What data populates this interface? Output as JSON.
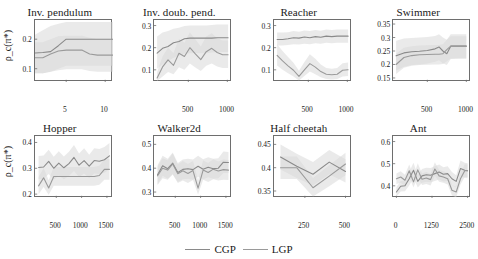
{
  "figure": {
    "ylabel": "ρ_c(π*)",
    "legend": [
      {
        "name": "CGP",
        "color": "#8a8a8a"
      },
      {
        "name": "LGP",
        "color": "#9a9a9a"
      }
    ]
  },
  "chart_data": [
    {
      "type": "line",
      "title": "Inv. pendulum",
      "xlabel": "",
      "ylabel": "ρ_c(π*)",
      "xlim": [
        1,
        11
      ],
      "ylim": [
        0.055,
        0.265
      ],
      "xticks": [
        5,
        10
      ],
      "yticks": [
        0.1,
        0.2
      ],
      "grid": false,
      "legend_position": "figure-bottom",
      "x": [
        1,
        2,
        3,
        4,
        5,
        6,
        7,
        8,
        9,
        10,
        11
      ],
      "series": [
        {
          "name": "CGP",
          "values": [
            0.153,
            0.155,
            0.158,
            0.178,
            0.2,
            0.2,
            0.2,
            0.2,
            0.2,
            0.2,
            0.2
          ],
          "band_lo": [
            0.085,
            0.085,
            0.09,
            0.1,
            0.11,
            0.11,
            0.11,
            0.11,
            0.11,
            0.11,
            0.11
          ],
          "band_hi": [
            0.215,
            0.23,
            0.245,
            0.252,
            0.258,
            0.258,
            0.258,
            0.258,
            0.258,
            0.258,
            0.258
          ]
        },
        {
          "name": "LGP",
          "values": [
            0.137,
            0.137,
            0.15,
            0.16,
            0.163,
            0.163,
            0.163,
            0.15,
            0.146,
            0.146,
            0.146
          ],
          "band_lo": [
            0.085,
            0.085,
            0.09,
            0.095,
            0.098,
            0.098,
            0.098,
            0.092,
            0.09,
            0.09,
            0.09
          ],
          "band_hi": [
            0.19,
            0.19,
            0.2,
            0.21,
            0.212,
            0.212,
            0.212,
            0.205,
            0.2,
            0.2,
            0.2
          ]
        }
      ]
    },
    {
      "type": "line",
      "title": "Inv. doub. pend.",
      "xlabel": "",
      "ylabel": "",
      "xlim": [
        60,
        1060
      ],
      "ylim": [
        0.045,
        0.325
      ],
      "xticks": [
        500,
        1000
      ],
      "yticks": [
        0.1,
        0.2,
        0.3
      ],
      "grid": false,
      "x": [
        100,
        170,
        240,
        310,
        380,
        450,
        520,
        590,
        660,
        730,
        800,
        870,
        940,
        1010
      ],
      "series": [
        {
          "name": "CGP",
          "values": [
            0.175,
            0.197,
            0.205,
            0.222,
            0.228,
            0.24,
            0.243,
            0.243,
            0.243,
            0.243,
            0.243,
            0.245,
            0.245,
            0.245
          ],
          "band_lo": [
            0.105,
            0.125,
            0.14,
            0.155,
            0.163,
            0.173,
            0.175,
            0.175,
            0.175,
            0.175,
            0.178,
            0.18,
            0.18,
            0.18
          ],
          "band_hi": [
            0.25,
            0.268,
            0.275,
            0.285,
            0.29,
            0.298,
            0.3,
            0.3,
            0.3,
            0.3,
            0.302,
            0.305,
            0.305,
            0.305
          ]
        },
        {
          "name": "LGP",
          "values": [
            0.063,
            0.113,
            0.145,
            0.12,
            0.175,
            0.16,
            0.2,
            0.172,
            0.146,
            0.182,
            0.197,
            0.178,
            0.168,
            0.168
          ],
          "band_lo": [
            0.05,
            0.07,
            0.09,
            0.08,
            0.112,
            0.1,
            0.128,
            0.11,
            0.095,
            0.118,
            0.128,
            0.115,
            0.108,
            0.108
          ],
          "band_hi": [
            0.09,
            0.16,
            0.2,
            0.175,
            0.24,
            0.222,
            0.268,
            0.238,
            0.205,
            0.25,
            0.265,
            0.243,
            0.232,
            0.232
          ]
        }
      ]
    },
    {
      "type": "line",
      "title": "Reacher",
      "xlabel": "",
      "ylabel": "",
      "xlim": [
        60,
        1060
      ],
      "ylim": [
        0.045,
        0.325
      ],
      "xticks": [
        500,
        1000
      ],
      "yticks": [
        0.1,
        0.2,
        0.3
      ],
      "grid": false,
      "x": [
        100,
        170,
        240,
        310,
        380,
        450,
        520,
        590,
        660,
        730,
        800,
        870,
        940,
        1010
      ],
      "series": [
        {
          "name": "CGP",
          "values": [
            0.237,
            0.237,
            0.24,
            0.245,
            0.243,
            0.248,
            0.245,
            0.25,
            0.247,
            0.252,
            0.25,
            0.252,
            0.252,
            0.252
          ],
          "band_lo": [
            0.21,
            0.21,
            0.212,
            0.215,
            0.214,
            0.218,
            0.216,
            0.22,
            0.218,
            0.222,
            0.22,
            0.222,
            0.222,
            0.222
          ],
          "band_hi": [
            0.268,
            0.268,
            0.27,
            0.275,
            0.272,
            0.278,
            0.275,
            0.28,
            0.277,
            0.282,
            0.28,
            0.282,
            0.282,
            0.282
          ]
        },
        {
          "name": "LGP",
          "values": [
            0.165,
            0.14,
            0.118,
            0.098,
            0.07,
            0.1,
            0.128,
            0.112,
            0.092,
            0.08,
            0.078,
            0.08,
            0.098,
            0.1
          ],
          "band_lo": [
            0.12,
            0.1,
            0.085,
            0.07,
            0.052,
            0.072,
            0.092,
            0.08,
            0.066,
            0.058,
            0.056,
            0.058,
            0.07,
            0.072
          ],
          "band_hi": [
            0.215,
            0.185,
            0.158,
            0.132,
            0.096,
            0.135,
            0.17,
            0.15,
            0.124,
            0.108,
            0.105,
            0.108,
            0.13,
            0.133
          ]
        }
      ]
    },
    {
      "type": "line",
      "title": "Swimmer",
      "xlabel": "",
      "ylabel": "",
      "xlim": [
        60,
        1060
      ],
      "ylim": [
        0.135,
        0.365
      ],
      "xticks": [
        500,
        1000
      ],
      "yticks": [
        0.15,
        0.2,
        0.25,
        0.3,
        0.35
      ],
      "grid": false,
      "x": [
        100,
        200,
        300,
        400,
        500,
        600,
        650,
        700,
        750,
        800,
        900,
        1000
      ],
      "series": [
        {
          "name": "CGP",
          "values": [
            0.232,
            0.243,
            0.247,
            0.249,
            0.252,
            0.258,
            0.265,
            0.25,
            0.24,
            0.268,
            0.268,
            0.268
          ],
          "band_lo": [
            0.178,
            0.192,
            0.198,
            0.2,
            0.204,
            0.21,
            0.216,
            0.205,
            0.198,
            0.22,
            0.222,
            0.222
          ],
          "band_hi": [
            0.288,
            0.296,
            0.298,
            0.3,
            0.302,
            0.306,
            0.312,
            0.3,
            0.292,
            0.312,
            0.312,
            0.312
          ]
        },
        {
          "name": "LGP",
          "values": [
            0.2,
            0.226,
            0.233,
            0.236,
            0.237,
            0.238,
            0.238,
            0.24,
            0.255,
            0.268,
            0.268,
            0.268
          ],
          "band_lo": [
            0.165,
            0.188,
            0.195,
            0.198,
            0.199,
            0.2,
            0.2,
            0.202,
            0.212,
            0.222,
            0.222,
            0.222
          ],
          "band_hi": [
            0.24,
            0.262,
            0.268,
            0.27,
            0.271,
            0.272,
            0.272,
            0.275,
            0.292,
            0.305,
            0.305,
            0.305
          ]
        }
      ]
    },
    {
      "type": "line",
      "title": "Hopper",
      "xlabel": "",
      "ylabel": "ρ_c(π*)",
      "xlim": [
        80,
        1620
      ],
      "ylim": [
        0.185,
        0.425
      ],
      "xticks": [
        500,
        1000,
        1500
      ],
      "yticks": [
        0.2,
        0.3,
        0.4
      ],
      "grid": false,
      "x": [
        150,
        250,
        350,
        450,
        550,
        650,
        750,
        850,
        950,
        1050,
        1150,
        1250,
        1350,
        1450,
        1550
      ],
      "series": [
        {
          "name": "CGP",
          "values": [
            0.303,
            0.305,
            0.327,
            0.3,
            0.32,
            0.302,
            0.318,
            0.342,
            0.312,
            0.33,
            0.308,
            0.33,
            0.327,
            0.333,
            0.348
          ],
          "band_lo": [
            0.258,
            0.26,
            0.278,
            0.256,
            0.272,
            0.258,
            0.27,
            0.29,
            0.266,
            0.28,
            0.262,
            0.28,
            0.278,
            0.283,
            0.296
          ],
          "band_hi": [
            0.348,
            0.35,
            0.372,
            0.345,
            0.366,
            0.346,
            0.364,
            0.39,
            0.357,
            0.378,
            0.352,
            0.378,
            0.375,
            0.382,
            0.398
          ]
        },
        {
          "name": "LGP",
          "values": [
            0.232,
            0.263,
            0.224,
            0.268,
            0.268,
            0.268,
            0.268,
            0.268,
            0.268,
            0.268,
            0.268,
            0.268,
            0.272,
            0.296,
            0.296
          ],
          "band_lo": [
            0.2,
            0.228,
            0.198,
            0.232,
            0.232,
            0.232,
            0.232,
            0.232,
            0.232,
            0.232,
            0.232,
            0.232,
            0.236,
            0.256,
            0.256
          ],
          "band_hi": [
            0.266,
            0.3,
            0.254,
            0.305,
            0.305,
            0.305,
            0.305,
            0.305,
            0.305,
            0.305,
            0.305,
            0.305,
            0.31,
            0.336,
            0.336
          ]
        }
      ]
    },
    {
      "type": "line",
      "title": "Walker2d",
      "xlabel": "",
      "ylabel": "",
      "xlim": [
        80,
        1620
      ],
      "ylim": [
        0.275,
        0.535
      ],
      "xticks": [
        500,
        1000,
        1500
      ],
      "yticks": [
        0.3,
        0.4,
        0.5
      ],
      "grid": false,
      "x": [
        150,
        250,
        350,
        450,
        550,
        650,
        750,
        850,
        950,
        1050,
        1150,
        1250,
        1350,
        1450,
        1550
      ],
      "series": [
        {
          "name": "CGP",
          "values": [
            0.372,
            0.41,
            0.398,
            0.421,
            0.382,
            0.395,
            0.398,
            0.394,
            0.408,
            0.396,
            0.404,
            0.398,
            0.4,
            0.425,
            0.424
          ],
          "band_lo": [
            0.332,
            0.368,
            0.356,
            0.376,
            0.342,
            0.354,
            0.356,
            0.352,
            0.364,
            0.354,
            0.362,
            0.356,
            0.358,
            0.38,
            0.38
          ],
          "band_hi": [
            0.412,
            0.452,
            0.44,
            0.466,
            0.422,
            0.436,
            0.44,
            0.436,
            0.452,
            0.438,
            0.446,
            0.44,
            0.442,
            0.47,
            0.468
          ]
        },
        {
          "name": "LGP",
          "values": [
            0.368,
            0.4,
            0.392,
            0.418,
            0.377,
            0.389,
            0.378,
            0.39,
            0.316,
            0.392,
            0.382,
            0.396,
            0.388,
            0.394,
            0.392
          ],
          "band_lo": [
            0.33,
            0.358,
            0.352,
            0.374,
            0.338,
            0.348,
            0.338,
            0.35,
            0.29,
            0.352,
            0.342,
            0.354,
            0.348,
            0.352,
            0.35
          ],
          "band_hi": [
            0.406,
            0.442,
            0.432,
            0.462,
            0.416,
            0.43,
            0.418,
            0.43,
            0.348,
            0.432,
            0.422,
            0.438,
            0.428,
            0.436,
            0.434
          ]
        }
      ]
    },
    {
      "type": "line",
      "title": "Half cheetah",
      "xlabel": "",
      "ylabel": "",
      "xlim": [
        60,
        540
      ],
      "ylim": [
        0.335,
        0.468
      ],
      "xticks": [
        250,
        500
      ],
      "yticks": [
        0.35,
        0.4,
        0.45
      ],
      "grid": false,
      "x": [
        100,
        200,
        300,
        400,
        500
      ],
      "series": [
        {
          "name": "CGP",
          "values": [
            0.423,
            0.403,
            0.386,
            0.412,
            0.392
          ],
          "band_lo": [
            0.396,
            0.378,
            0.362,
            0.386,
            0.368
          ],
          "band_hi": [
            0.45,
            0.43,
            0.412,
            0.438,
            0.418
          ]
        },
        {
          "name": "LGP",
          "values": [
            0.4,
            0.4,
            0.357,
            0.382,
            0.408
          ],
          "band_lo": [
            0.376,
            0.376,
            0.338,
            0.36,
            0.384
          ],
          "band_hi": [
            0.424,
            0.424,
            0.378,
            0.405,
            0.432
          ]
        }
      ]
    },
    {
      "type": "line",
      "title": "Ant",
      "xlabel": "",
      "ylabel": "",
      "xlim": [
        -120,
        2620
      ],
      "ylim": [
        0.345,
        0.625
      ],
      "xticks": [
        0,
        1250,
        2500
      ],
      "yticks": [
        0.4,
        0.5,
        0.6
      ],
      "grid": false,
      "x": [
        0,
        150,
        300,
        450,
        600,
        750,
        900,
        1050,
        1200,
        1350,
        1500,
        1650,
        1800,
        1950,
        2100,
        2250,
        2400,
        2500
      ],
      "series": [
        {
          "name": "CGP",
          "values": [
            0.372,
            0.398,
            0.4,
            0.432,
            0.47,
            0.42,
            0.445,
            0.45,
            0.448,
            0.455,
            0.462,
            0.452,
            0.455,
            0.432,
            0.42,
            0.478,
            0.47,
            0.468
          ],
          "band_lo": [
            0.352,
            0.374,
            0.376,
            0.402,
            0.436,
            0.392,
            0.414,
            0.418,
            0.416,
            0.422,
            0.428,
            0.42,
            0.422,
            0.402,
            0.392,
            0.442,
            0.436,
            0.434
          ],
          "band_hi": [
            0.394,
            0.422,
            0.424,
            0.462,
            0.504,
            0.448,
            0.476,
            0.482,
            0.48,
            0.488,
            0.496,
            0.484,
            0.488,
            0.462,
            0.448,
            0.514,
            0.504,
            0.502
          ]
        },
        {
          "name": "LGP",
          "values": [
            0.432,
            0.44,
            0.425,
            0.468,
            0.418,
            0.472,
            0.43,
            0.435,
            0.428,
            0.476,
            0.445,
            0.44,
            0.432,
            0.38,
            0.372,
            0.432,
            0.468,
            0.468
          ],
          "band_lo": [
            0.408,
            0.414,
            0.4,
            0.44,
            0.392,
            0.442,
            0.404,
            0.408,
            0.402,
            0.446,
            0.418,
            0.414,
            0.406,
            0.356,
            0.348,
            0.406,
            0.44,
            0.44
          ],
          "band_hi": [
            0.456,
            0.466,
            0.45,
            0.496,
            0.444,
            0.502,
            0.456,
            0.462,
            0.454,
            0.506,
            0.472,
            0.466,
            0.458,
            0.404,
            0.396,
            0.458,
            0.496,
            0.496
          ]
        }
      ]
    }
  ]
}
